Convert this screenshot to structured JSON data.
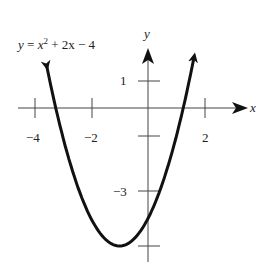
{
  "chart_data": {
    "type": "line",
    "equation": {
      "lhs": "y",
      "x_var": "x",
      "exp": "2",
      "rest": " + 2x − 4"
    },
    "xlabel": "x",
    "ylabel": "y",
    "x_ticks": [
      -4,
      -2,
      2
    ],
    "x_tick_labels": [
      "−4",
      "−2",
      "2"
    ],
    "y_ticks": [
      1,
      -1,
      -3,
      -5
    ],
    "y_tick_labels": [
      "1",
      "−3"
    ],
    "function": "x^2 + 2x - 4",
    "vertex": [
      -1,
      -5
    ],
    "x_range": [
      -4.4,
      2.3
    ],
    "y_range": [
      -5.8,
      2.6
    ],
    "grid": false,
    "line_color": "#111111",
    "axis_color": "#444444"
  }
}
